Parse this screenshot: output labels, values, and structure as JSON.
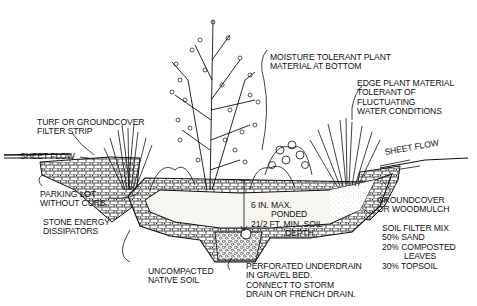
{
  "diagram": {
    "colors": {
      "ink": "#111111",
      "paper": "#ffffff",
      "soil": "#f1efe8"
    },
    "labels": {
      "turf": {
        "line1": "TURF OR GROUNDCOVER",
        "line2": "FILTER STRIP"
      },
      "sheet_flow_left": "SHEET FLOW",
      "parking": {
        "line1": "PARKING LOT",
        "line2": "WITHOUT CURB"
      },
      "stone": {
        "line1": "STONE ENERGY",
        "line2": "DISSIPATORS"
      },
      "uncompacted": {
        "line1": "UNCOMPACTED",
        "line2": "NATIVE SOIL"
      },
      "moisture": {
        "line1": "MOISTURE TOLERANT PLANT",
        "line2": "MATERIAL AT BOTTOM"
      },
      "edge": {
        "line1": "EDGE PLANT MATERIAL",
        "line2": "TOLERANT OF",
        "line3": "FLUCTUATING",
        "line4": "WATER CONDITIONS"
      },
      "sheet_flow_right": "SHEET FLOW",
      "groundcover": {
        "line1": "GROUNDCOVER",
        "line2": "OR WOODMULCH"
      },
      "soil_mix": {
        "line1": "SOIL FILTER MIX",
        "line2": "50% SAND",
        "line3": "20% COMPOSTED",
        "line4": "LEAVES",
        "line5": "30% TOPSOIL"
      },
      "ponded": {
        "line1": "6 IN. MAX.",
        "line2": "PONDED",
        "line3": "21/2 FT. MIN. SOIL",
        "line4": "DEPTH"
      },
      "underdrain": {
        "line1": "PERFORATED UNDERDRAIN",
        "line2": "IN GRAVEL BED.",
        "line3": "CONNECT TO STORM",
        "line4": "DRAIN OR FRENCH DRAIN."
      }
    }
  }
}
